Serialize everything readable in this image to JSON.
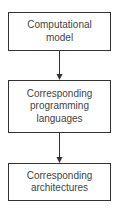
{
  "diagram": {
    "type": "flowchart",
    "nodes": [
      {
        "id": "n1",
        "lines": [
          "Computational",
          "model"
        ]
      },
      {
        "id": "n2",
        "lines": [
          "Corresponding",
          "programming",
          "languages"
        ]
      },
      {
        "id": "n3",
        "lines": [
          "Corresponding",
          "architectures"
        ]
      }
    ],
    "edges": [
      {
        "from": "n1",
        "to": "n2"
      },
      {
        "from": "n2",
        "to": "n3"
      }
    ],
    "colors": {
      "border": "#333333",
      "text": "#444444",
      "arrow": "#333333"
    }
  }
}
